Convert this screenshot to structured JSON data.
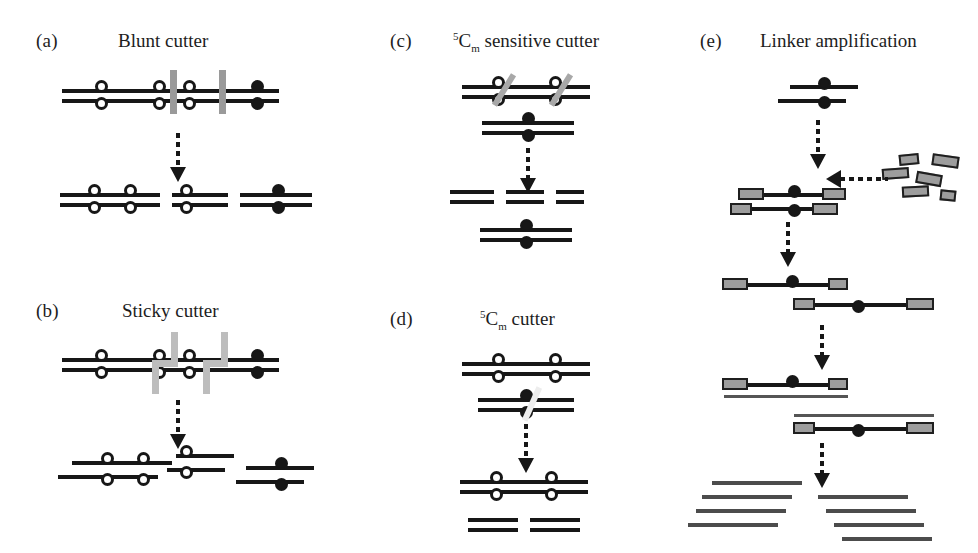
{
  "figure": {
    "width": 978,
    "height": 553,
    "background": "#ffffff",
    "ink": "#171717",
    "cut_mark_color": "#9a9a9a",
    "linker_fill": "#9d9d9d",
    "amplified_strand_color": "#555555"
  },
  "panels": [
    {
      "id": "a",
      "tag": "(a)",
      "title_plain": "Blunt cutter",
      "title_html": "Blunt cutter",
      "description": "Double-stranded DNA with unmethylated (open circle) and methylated (filled circle) CpG sites; enzyme cuts straight through both strands producing blunt-ended fragments.",
      "cut_style": "blunt",
      "substrate_sites": [
        "open",
        "open",
        "open",
        "filled"
      ],
      "cut_positions": [
        2,
        3
      ],
      "products": [
        {
          "sites": [
            "open",
            "open"
          ],
          "ends": "blunt"
        },
        {
          "sites": [
            "open"
          ],
          "ends": "blunt"
        },
        {
          "sites": [
            "filled"
          ],
          "ends": "blunt"
        }
      ]
    },
    {
      "id": "b",
      "tag": "(b)",
      "title_plain": "Sticky cutter",
      "title_html": "Sticky cutter",
      "description": "Enzyme makes staggered cuts, producing fragments with single-stranded overhangs (sticky ends).",
      "cut_style": "staggered",
      "substrate_sites": [
        "open",
        "open",
        "open",
        "filled"
      ],
      "cut_positions": [
        2,
        3
      ],
      "products": [
        {
          "sites": [
            "open",
            "open"
          ],
          "ends": "sticky"
        },
        {
          "sites": [
            "open"
          ],
          "ends": "sticky"
        },
        {
          "sites": [
            "filled"
          ],
          "ends": "sticky"
        }
      ]
    },
    {
      "id": "c",
      "tag": "(c)",
      "title_plain": "5Cm sensitive cutter",
      "title_sup": "5",
      "title_base": "C",
      "title_sub": "m",
      "title_rest": " sensitive cutter",
      "description": "Methylation-sensitive enzyme cleaves only the unmethylated duplex; the methylated duplex remains intact.",
      "cut_style": "slash",
      "substrates": [
        {
          "sites": [
            "open",
            "open"
          ],
          "cut": true
        },
        {
          "sites": [
            "filled"
          ],
          "cut": false
        }
      ],
      "products": [
        {
          "fragments": 3,
          "sites": [],
          "note": "unmethylated DNA digested into fragments"
        },
        {
          "sites": [
            "filled"
          ],
          "note": "methylated duplex uncut"
        }
      ]
    },
    {
      "id": "d",
      "tag": "(d)",
      "title_plain": "5Cm cutter",
      "title_sup": "5",
      "title_base": "C",
      "title_sub": "m",
      "title_rest": " cutter",
      "description": "Methylation-dependent enzyme cleaves only the methylated duplex; the unmethylated duplex remains intact.",
      "cut_style": "slash",
      "substrates": [
        {
          "sites": [
            "open",
            "open"
          ],
          "cut": false
        },
        {
          "sites": [
            "filled"
          ],
          "cut": true
        }
      ],
      "products": [
        {
          "sites": [
            "open",
            "open"
          ],
          "note": "unmethylated duplex uncut"
        },
        {
          "fragments": 2,
          "sites": [],
          "note": "methylated DNA digested into fragments"
        }
      ]
    },
    {
      "id": "e",
      "tag": "(e)",
      "title_plain": "Linker amplification",
      "title_html": "Linker amplification",
      "description": "Sticky-ended methylated fragment is ligated to linkers, denatured, extended and amplified into many copies.",
      "steps": [
        {
          "step": 1,
          "label": "sticky-ended methylated fragment"
        },
        {
          "step": 2,
          "label": "linkers added and ligated to both ends"
        },
        {
          "step": 3,
          "label": "strands separated, each carrying linkers"
        },
        {
          "step": 4,
          "label": "complementary strands synthesised"
        },
        {
          "step": 5,
          "label": "amplified product strands"
        }
      ],
      "linker_count": 6,
      "amplified_strands_left": 4,
      "amplified_strands_right": 4
    }
  ],
  "legend": {
    "open_circle": "unmethylated CpG site",
    "filled_circle": "methylated CpG site (5-methylcytosine)",
    "gray_bar": "restriction enzyme cut site",
    "gray_box": "oligonucleotide linker"
  }
}
